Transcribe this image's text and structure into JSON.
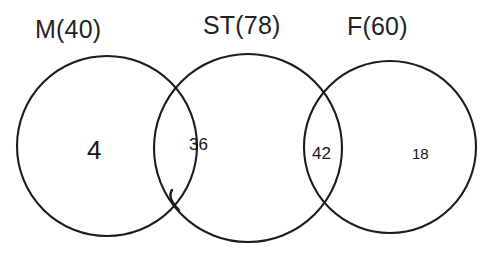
{
  "diagram": {
    "type": "venn-chain-3",
    "background_color": "#ffffff",
    "stroke_color": "#1c1c1c",
    "title": "",
    "sets": [
      {
        "id": "M",
        "label": "M(40)",
        "name": "M",
        "total": 40,
        "label_x": 35,
        "label_y": 17,
        "circle": {
          "cx": 107,
          "cy": 146,
          "r": 90
        }
      },
      {
        "id": "ST",
        "label": "ST(78)",
        "name": "ST",
        "total": 78,
        "label_x": 203,
        "label_y": 13,
        "circle": {
          "cx": 248,
          "cy": 148,
          "r": 94
        }
      },
      {
        "id": "F",
        "label": "F(60)",
        "name": "F",
        "total": 60,
        "label_x": 347,
        "label_y": 14,
        "circle": {
          "cx": 390,
          "cy": 147,
          "r": 86
        }
      }
    ],
    "regions": [
      {
        "id": "M-only",
        "value": "4",
        "number": 4,
        "belongs_to": "M",
        "x": 87,
        "y": 137,
        "size": "big"
      },
      {
        "id": "M-and-ST",
        "value": "36",
        "number": 36,
        "belongs_to": "M,ST",
        "x": 189,
        "y": 136,
        "size": "mid"
      },
      {
        "id": "ST-and-F",
        "value": "42",
        "number": 42,
        "belongs_to": "ST,F",
        "x": 312,
        "y": 145,
        "size": "mid"
      },
      {
        "id": "F-only",
        "value": "18",
        "number": 18,
        "belongs_to": "F",
        "x": 412,
        "y": 146,
        "size": "small"
      }
    ]
  },
  "chart_data": {
    "type": "diagram",
    "title": "",
    "subtype": "venn",
    "set_labels": [
      "M(40)",
      "ST(78)",
      "F(60)"
    ],
    "set_totals": [
      40,
      78,
      60
    ],
    "region_labels": [
      "M only",
      "M ∩ ST",
      "ST ∩ F",
      "F only"
    ],
    "region_values": [
      4,
      36,
      42,
      18
    ],
    "legend_position": "top",
    "grid": false
  }
}
